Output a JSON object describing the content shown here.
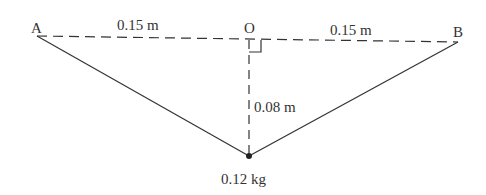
{
  "diagram": {
    "points": {
      "A": "A",
      "O": "O",
      "B": "B"
    },
    "labels": {
      "AO_distance": "0.15 m",
      "OB_distance": "0.15 m",
      "vertical_distance": "0.08 m",
      "mass": "0.12 kg"
    },
    "colors": {
      "line": "#333333",
      "text": "#333333"
    }
  }
}
